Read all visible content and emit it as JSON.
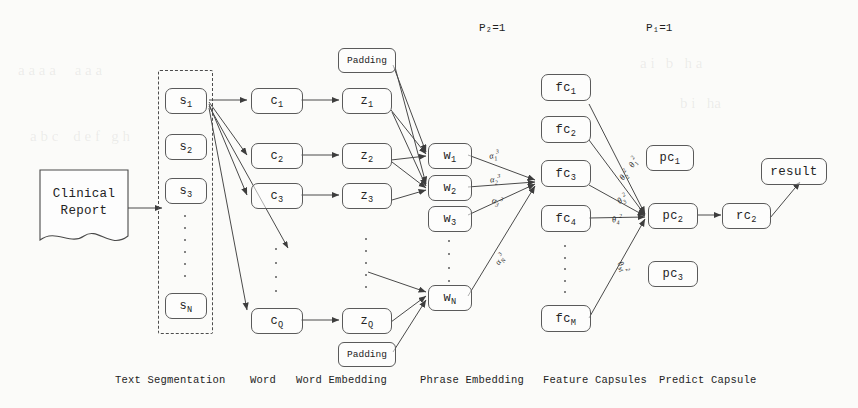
{
  "figure": {
    "background_color": "#fbfbf9",
    "stroke_color": "#5a5a5a"
  },
  "source_document": {
    "label_line1": "Clinical",
    "label_line2": "Report"
  },
  "top_labels": {
    "p2": "P₂=1",
    "p1": "P₁=1"
  },
  "stage_captions": [
    {
      "id": "text-segmentation",
      "label": "Text Segmentation"
    },
    {
      "id": "word",
      "label": "Word"
    },
    {
      "id": "word-embedding",
      "label": "Word Embedding"
    },
    {
      "id": "phrase-embedding",
      "label": "Phrase Embedding"
    },
    {
      "id": "feature-capsules",
      "label": "Feature Capsules"
    },
    {
      "id": "predict-capsule",
      "label": "Predict Capsule"
    }
  ],
  "columns": {
    "sentences": {
      "name": "sentence-segments",
      "nodes": [
        {
          "id": "s1",
          "base": "s",
          "sub": "1"
        },
        {
          "id": "s2",
          "base": "s",
          "sub": "2"
        },
        {
          "id": "s3",
          "base": "s",
          "sub": "3"
        },
        {
          "id": "sN",
          "base": "s",
          "sub": "N"
        }
      ],
      "has_ellipsis": true
    },
    "words": {
      "name": "word-tokens",
      "nodes": [
        {
          "id": "c1",
          "base": "c",
          "sub": "1"
        },
        {
          "id": "c2",
          "base": "c",
          "sub": "2"
        },
        {
          "id": "c3",
          "base": "c",
          "sub": "3"
        },
        {
          "id": "cQ",
          "base": "c",
          "sub": "Q"
        }
      ],
      "has_ellipsis": true
    },
    "word_embeddings": {
      "name": "word-embeddings",
      "nodes": [
        {
          "id": "z1",
          "base": "z",
          "sub": "1"
        },
        {
          "id": "z2",
          "base": "z",
          "sub": "2"
        },
        {
          "id": "z3",
          "base": "z",
          "sub": "3"
        },
        {
          "id": "zQ",
          "base": "z",
          "sub": "Q"
        }
      ],
      "has_ellipsis": true,
      "padding_top": "Padding",
      "padding_bottom": "Padding"
    },
    "phrase_embeddings": {
      "name": "phrase-embeddings",
      "nodes": [
        {
          "id": "w1",
          "base": "w",
          "sub": "1"
        },
        {
          "id": "w2",
          "base": "w",
          "sub": "2"
        },
        {
          "id": "w3",
          "base": "w",
          "sub": "3"
        },
        {
          "id": "wN",
          "base": "w",
          "sub": "N"
        }
      ],
      "has_ellipsis": true
    },
    "feature_capsules": {
      "name": "feature-capsules",
      "nodes": [
        {
          "id": "fc1",
          "base": "fc",
          "sub": "1"
        },
        {
          "id": "fc2",
          "base": "fc",
          "sub": "2"
        },
        {
          "id": "fc3",
          "base": "fc",
          "sub": "3"
        },
        {
          "id": "fc4",
          "base": "fc",
          "sub": "4"
        },
        {
          "id": "fcM",
          "base": "fc",
          "sub": "M"
        }
      ],
      "has_ellipsis": true
    },
    "predict_capsules": {
      "name": "predict-capsules",
      "nodes": [
        {
          "id": "pc1",
          "base": "pc",
          "sub": "1"
        },
        {
          "id": "pc2",
          "base": "pc",
          "sub": "2"
        },
        {
          "id": "pc3",
          "base": "pc",
          "sub": "3"
        }
      ]
    },
    "result_capsule": {
      "name": "result-capsule",
      "nodes": [
        {
          "id": "rc2",
          "base": "rc",
          "sub": "2"
        }
      ]
    },
    "result": {
      "name": "result-node",
      "label": "result"
    }
  },
  "edge_labels": {
    "attention_alpha": [
      {
        "id": "alpha-1-3",
        "base": "α",
        "sub": "1",
        "sup": "3"
      },
      {
        "id": "alpha-2-3",
        "base": "α",
        "sub": "2",
        "sup": "3"
      },
      {
        "id": "alpha-3-3",
        "base": "α",
        "sub": "3",
        "sup": "3"
      },
      {
        "id": "alpha-N-3",
        "base": "α",
        "sub": "N",
        "sup": "3"
      }
    ],
    "routing_theta": [
      {
        "id": "theta-1-2",
        "base": "θ",
        "sub": "1",
        "sup": "2"
      },
      {
        "id": "theta-2-2",
        "base": "θ",
        "sub": "2",
        "sup": "2"
      },
      {
        "id": "theta-3-2",
        "base": "θ",
        "sub": "3",
        "sup": "2"
      },
      {
        "id": "theta-4-2",
        "base": "θ",
        "sub": "4",
        "sup": "2"
      },
      {
        "id": "theta-M-2",
        "base": "θ",
        "sub": "M",
        "sup": "2"
      }
    ]
  }
}
